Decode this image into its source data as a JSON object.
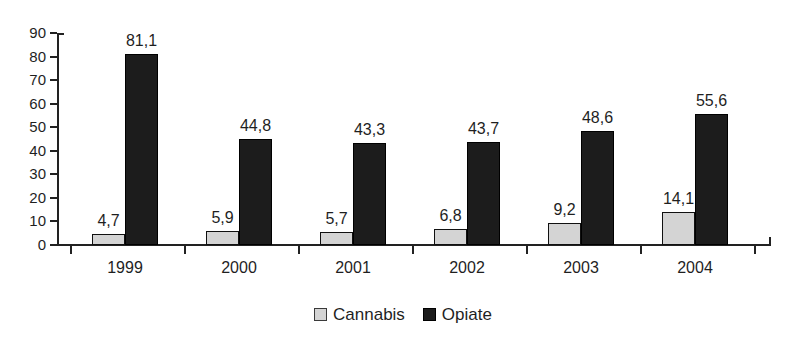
{
  "chart_data": {
    "type": "bar",
    "title": "",
    "subtitle": "",
    "xlabel": "",
    "ylabel": "",
    "ylim": [
      0,
      90
    ],
    "ytick_step": 10,
    "yticks": [
      "90",
      "80",
      "70",
      "60",
      "50",
      "40",
      "30",
      "20",
      "10",
      "0"
    ],
    "grid": false,
    "legend_position": "bottom-center",
    "decimal_separator": ",",
    "categories": [
      "1999",
      "2000",
      "2001",
      "2002",
      "2003",
      "2004"
    ],
    "series": [
      {
        "name": "Cannabis",
        "color": "#d4d4d4",
        "values": [
          4.7,
          5.9,
          5.7,
          6.8,
          9.2,
          14.1
        ],
        "labels": [
          "4,7",
          "5,9",
          "5,7",
          "6,8",
          "9,2",
          "14,1"
        ]
      },
      {
        "name": "Opiate",
        "color": "#1c1c1c",
        "values": [
          81.1,
          44.8,
          43.3,
          43.7,
          48.6,
          55.6
        ],
        "labels": [
          "81,1",
          "44,8",
          "43,3",
          "43,7",
          "48,6",
          "55,6"
        ]
      }
    ]
  },
  "legend": {
    "items": [
      {
        "label": "Cannabis",
        "swatch": "cannabis-swatch"
      },
      {
        "label": "Opiate",
        "swatch": "opiate-swatch"
      }
    ]
  },
  "axis": {
    "y": {
      "ticks": [
        "90",
        "80",
        "70",
        "60",
        "50",
        "40",
        "30",
        "20",
        "10",
        "0"
      ]
    },
    "x": {
      "ticks": [
        "1999",
        "2000",
        "2001",
        "2002",
        "2003",
        "2004"
      ]
    }
  }
}
